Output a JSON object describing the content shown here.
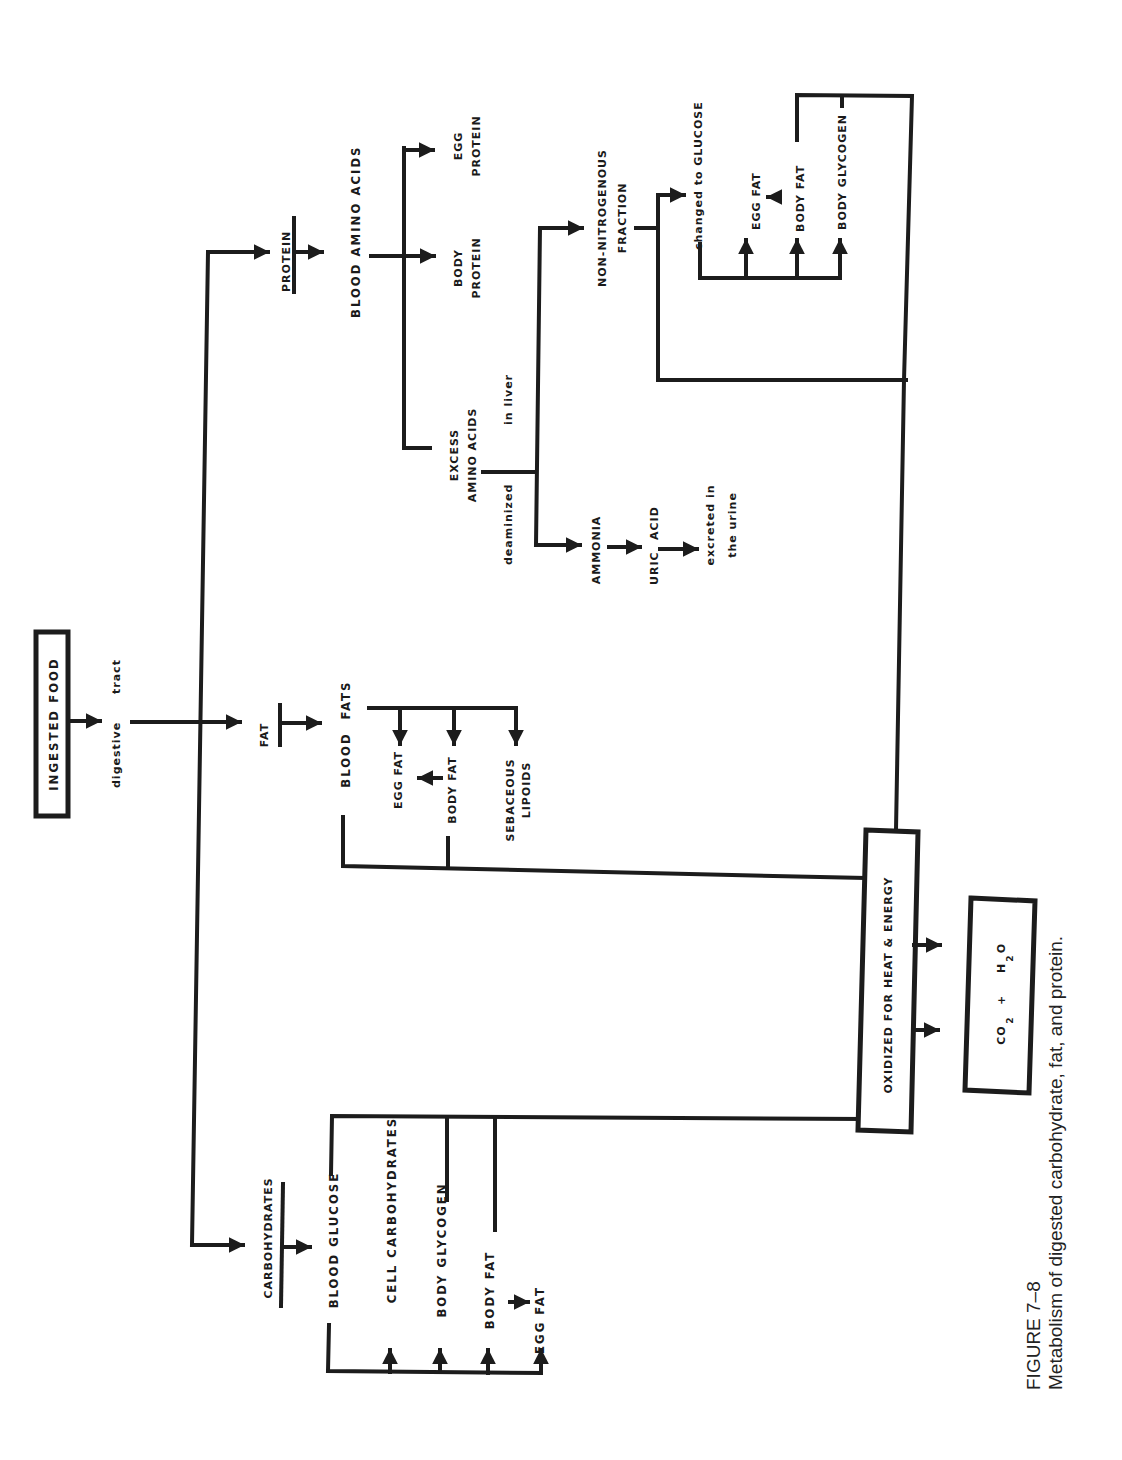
{
  "figure": {
    "number": "FIGURE 7–8",
    "caption": "Metabolism of digested carbohydrate, fat, and protein.",
    "orientation": "rotated 90° counter-clockwise"
  },
  "colors": {
    "ink": "#1c1c1c",
    "paper": "#ffffff"
  },
  "nodes": {
    "ingested_food": "INGESTED    FOOD",
    "digestive": "digestive",
    "tract": "tract",
    "protein": "PROTEIN",
    "blood_amino_acids": "BLOOD   AMINO   ACIDS",
    "body_protein_1": "BODY",
    "body_protein_2": "PROTEIN",
    "egg_protein_1": "EGG",
    "egg_protein_2": "PROTEIN",
    "excess_1": "EXCESS",
    "excess_2": "AMINO ACIDS",
    "deaminized": "deaminized",
    "in_liver": "in   liver",
    "ammonia": "AMMONIA",
    "uric": "URIC",
    "acid": "ACID",
    "excreted_1": "excreted in",
    "excreted_2": "the urine",
    "non_nitro_1": "NON-NITROGENOUS",
    "non_nitro_2": "FRACTION",
    "changed_to_glucose": "changed to GLUCOSE",
    "p_egg_fat": "EGG  FAT",
    "p_body_fat": "BODY  FAT",
    "p_body_glycogen": "BODY GLYCOGEN",
    "fat": "FAT",
    "blood": "BLOOD",
    "fats": "FATS",
    "f_egg_fat": "EGG  FAT",
    "f_body_fat": "BODY  FAT",
    "sebaceous_1": "SEBACEOUS",
    "sebaceous_2": "LIPOIDS",
    "carbohydrates": "CARBOHYDRATES",
    "blood_glucose": "BLOOD   GLUCOSE",
    "cell_carbs": "CELL   CARBOHYDRATES",
    "c_body_glycogen": "BODY   GLYCOGEN",
    "c_body_fat": "BODY   FAT",
    "c_egg_fat": "EGG   FAT",
    "oxidized": "OXIDIZED  FOR  HEAT  &  ENERGY",
    "co2": "CO",
    "co2_sub": "2",
    "plus": "+",
    "h2o_h": "H",
    "h2o_sub": "2",
    "h2o_o": "O"
  }
}
